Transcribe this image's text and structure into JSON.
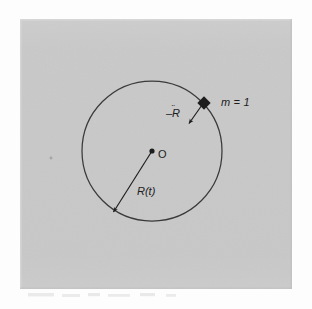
{
  "figure": {
    "type": "geometry-diagram",
    "background_color": "#c9c9c9",
    "page_color": "#fdfdfd",
    "ink_color": "#1d1d1d",
    "panel": {
      "x": 20,
      "y": 19,
      "width": 272,
      "height": 270
    },
    "circle": {
      "center_x": 152,
      "center_y": 151,
      "radius": 70,
      "stroke": "#3a3a3a",
      "stroke_width": 1.2,
      "fill": "none"
    },
    "origin_point": {
      "x": 152,
      "y": 151,
      "r": 2.6
    },
    "mass_marker": {
      "x": 204,
      "y": 103,
      "size": 5.2,
      "shape": "diamond"
    },
    "vectors": [
      {
        "name": "radius-vector",
        "label": "R(t)",
        "from_x": 152,
        "from_y": 151,
        "to_x": 112,
        "to_y": 214
      },
      {
        "name": "acceleration-vector",
        "label": "-R",
        "from_x": 204,
        "from_y": 103,
        "to_x": 188,
        "to_y": 125
      }
    ],
    "labels": {
      "mass": "m = 1",
      "acceleration_base": "–R",
      "acceleration_accent": "¨",
      "radius": "R(t)",
      "origin": "O"
    },
    "speck": {
      "x": 51,
      "y": 158,
      "width": 2,
      "height": 3
    }
  }
}
